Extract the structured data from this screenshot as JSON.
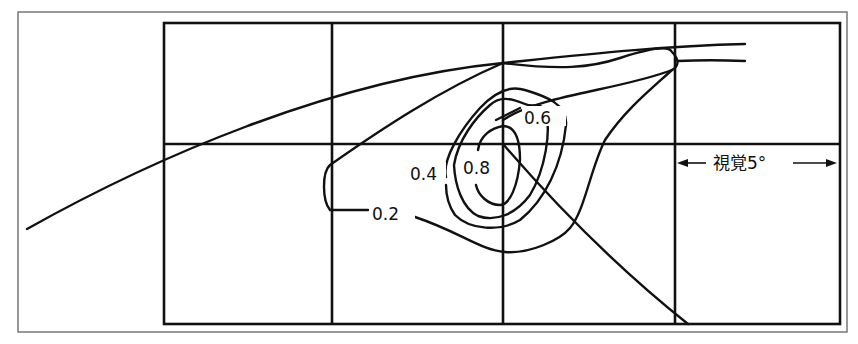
{
  "figure": {
    "type": "contour-diagram",
    "contour_labels": [
      "0.2",
      "0.4",
      "0.6",
      "0.8"
    ],
    "scale_label": "視覚5°",
    "colors": {
      "line": "#111111",
      "frame": "#777777",
      "background": "#ffffff"
    }
  }
}
